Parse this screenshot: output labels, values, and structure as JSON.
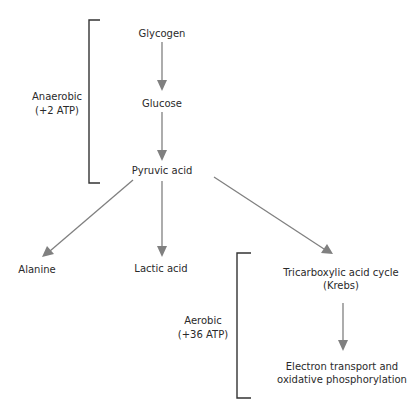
{
  "nodes": {
    "glycogen": "Glycogen",
    "glucose": "Glucose",
    "pyruvic_acid": "Pyruvic acid",
    "alanine": "Alanine",
    "lactic_acid": "Lactic acid",
    "tca_line1": "Tricarboxylic acid cycle",
    "tca_line2": "(Krebs)",
    "etc_line1": "Electron transport and",
    "etc_line2": "oxidative phosphorylation"
  },
  "brackets": {
    "anaerobic_line1": "Anaerobic",
    "anaerobic_line2": "(+2 ATP)",
    "aerobic_line1": "Aerobic",
    "aerobic_line2": "(+36 ATP)"
  },
  "edges": [
    {
      "from": "Glycogen",
      "to": "Glucose"
    },
    {
      "from": "Glucose",
      "to": "Pyruvic acid"
    },
    {
      "from": "Pyruvic acid",
      "to": "Alanine"
    },
    {
      "from": "Pyruvic acid",
      "to": "Lactic acid"
    },
    {
      "from": "Pyruvic acid",
      "to": "Tricarboxylic acid cycle (Krebs)"
    },
    {
      "from": "Tricarboxylic acid cycle (Krebs)",
      "to": "Electron transport and oxidative phosphorylation"
    }
  ],
  "colors": {
    "arrow": "#808080",
    "bracket": "#333333",
    "text": "#2a2a2a"
  }
}
